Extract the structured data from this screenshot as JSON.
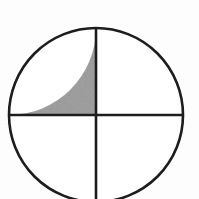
{
  "figure": {
    "title": "Quartered circle with shaded upper-left quadrant",
    "caption": "",
    "background_color": "#fdfdfd"
  },
  "chart_data": {
    "type": "pie",
    "title": "Quartered circle with shaded upper-left quadrant",
    "subtitle": "",
    "xlabel": "",
    "ylabel": "",
    "categories": [
      "upper-left",
      "upper-right",
      "lower-left",
      "lower-right"
    ],
    "values": [
      25,
      25,
      25,
      25
    ],
    "value_unit": "percent",
    "labels_shown": false,
    "legend": false,
    "legend_position": "none",
    "grid": false,
    "slices": [
      {
        "name": "upper-left",
        "fraction": 0.25,
        "percent": 25,
        "start_angle_deg": 90,
        "end_angle_deg": 180,
        "fill": "#808080",
        "fill_style": "halftone-gray",
        "shaded": true,
        "label": ""
      },
      {
        "name": "upper-right",
        "fraction": 0.25,
        "percent": 25,
        "start_angle_deg": 0,
        "end_angle_deg": 90,
        "fill": "#ffffff",
        "fill_style": "solid-white",
        "shaded": false,
        "label": ""
      },
      {
        "name": "lower-right",
        "fraction": 0.25,
        "percent": 25,
        "start_angle_deg": 270,
        "end_angle_deg": 360,
        "fill": "#ffffff",
        "fill_style": "solid-white",
        "shaded": false,
        "label": ""
      },
      {
        "name": "lower-left",
        "fraction": 0.25,
        "percent": 25,
        "start_angle_deg": 180,
        "end_angle_deg": 270,
        "fill": "#ffffff",
        "fill_style": "solid-white",
        "shaded": false,
        "label": ""
      }
    ],
    "geometry": {
      "center_x": 96,
      "center_y": 115,
      "radius": 87,
      "clipped_at_bottom": true,
      "view_width": 199,
      "view_height": 199
    },
    "style": {
      "outline_color": "#1d1d1d",
      "outline_width": 2.6,
      "divider_color": "#1d1d1d",
      "divider_width": 2.6,
      "shaded_fill": "#808080",
      "unshaded_fill": "#ffffff",
      "background": "#fdfdfd"
    },
    "dividers": [
      {
        "name": "vertical-diameter",
        "orientation": "vertical",
        "angle_deg": 90
      },
      {
        "name": "horizontal-diameter",
        "orientation": "horizontal",
        "angle_deg": 0
      }
    ]
  }
}
